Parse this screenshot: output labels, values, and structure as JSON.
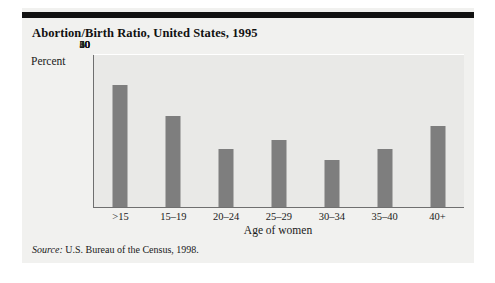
{
  "figure": {
    "title": "Abortion/Birth Ratio, United States, 1995",
    "source_label": "Source:",
    "source_text": " U.S. Bureau of the Census, 1998.",
    "colors": {
      "bar_fill": "#7e7e7e",
      "plot_background": "#e9e9e7",
      "panel_background": "#f1f1ef",
      "gridline": "#ffffff",
      "axis_line": "#6f6f6f",
      "rule": "#111111",
      "text": "#1a1a1a"
    }
  },
  "chart_data": {
    "type": "bar",
    "title": "Abortion/Birth Ratio, United States, 1995",
    "subtitle": "",
    "xlabel": "Age of women",
    "ylabel": "Percent",
    "categories": [
      ">15",
      "15–19",
      "20–24",
      "25–29",
      "30–34",
      "35–40",
      "40+"
    ],
    "values": [
      48,
      36,
      23,
      26.5,
      18.5,
      23,
      32
    ],
    "ylim": [
      0,
      60
    ],
    "ytick_labels": [
      "0",
      "10",
      "20",
      "30",
      "40",
      "50",
      "60"
    ],
    "ytick_values": [
      0,
      10,
      20,
      30,
      40,
      50,
      60
    ],
    "grid": "horizontal",
    "legend": "none",
    "series": [
      {
        "name": "Abortion/Birth Ratio",
        "values": [
          48,
          36,
          23,
          26.5,
          18.5,
          23,
          32
        ]
      }
    ]
  }
}
